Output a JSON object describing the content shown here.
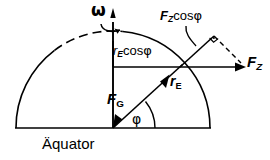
{
  "figure": {
    "kind": "physics-vector-diagram",
    "background_color": "#ffffff",
    "stroke_color": "#000000",
    "width": 270,
    "height": 160
  },
  "labels": {
    "omega": "ω",
    "fz_cos_phi": {
      "symbol": "F",
      "subscript": "Z",
      "rest": "cos",
      "angle": "φ"
    },
    "re_cos_phi": {
      "symbol": "r",
      "subscript": "E",
      "rest": "cos",
      "angle": "φ"
    },
    "fz": {
      "symbol": "F",
      "subscript": "Z"
    },
    "re": {
      "symbol": "r",
      "subscript": "E"
    },
    "fg": {
      "symbol": "F",
      "subscript": "G"
    },
    "phi": "φ",
    "equator": "Äquator"
  },
  "geometry": {
    "center": {
      "x": 113,
      "y": 128
    },
    "radius": 97,
    "baseline": {
      "x1": 16,
      "y1": 128,
      "x2": 210,
      "y2": 128
    },
    "polar_axis": {
      "x": 113,
      "y_top": 20,
      "y_bottom": 128
    },
    "surface_point": {
      "x": 180,
      "y": 67
    },
    "latitude_angle_deg": 39,
    "fz_arrow_tip": {
      "x": 245,
      "y": 67
    },
    "triangle_apex": {
      "x": 213,
      "y": 37
    },
    "right_angle_marker": true,
    "dashed_arc_top": true,
    "dashed_hypotenuse": true
  },
  "colors": {
    "ink": "#000000",
    "paper": "#ffffff"
  }
}
